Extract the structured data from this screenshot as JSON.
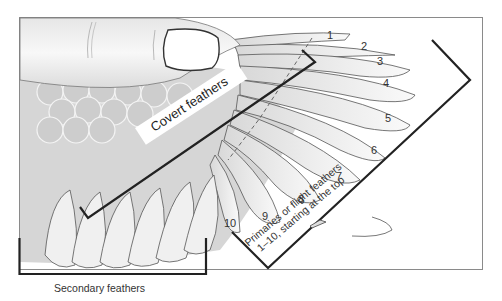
{
  "diagram": {
    "labels": {
      "covert": "Covert feathers",
      "primaries_line1": "Primaries or flight feathers",
      "primaries_line2": "1–10, starting at the top",
      "secondary": "Secondary feathers"
    },
    "primary_numbers": [
      "1",
      "2",
      "3",
      "4",
      "5",
      "6",
      "7",
      "8",
      "9",
      "10"
    ],
    "colors": {
      "frame": "#8a8a8a",
      "bracket": "#2a2a2a",
      "feather_fill": "#ececec",
      "covert_fill": "#cfcfcf",
      "thumb_fill": "#f2f2f2",
      "outline": "#444444"
    }
  }
}
